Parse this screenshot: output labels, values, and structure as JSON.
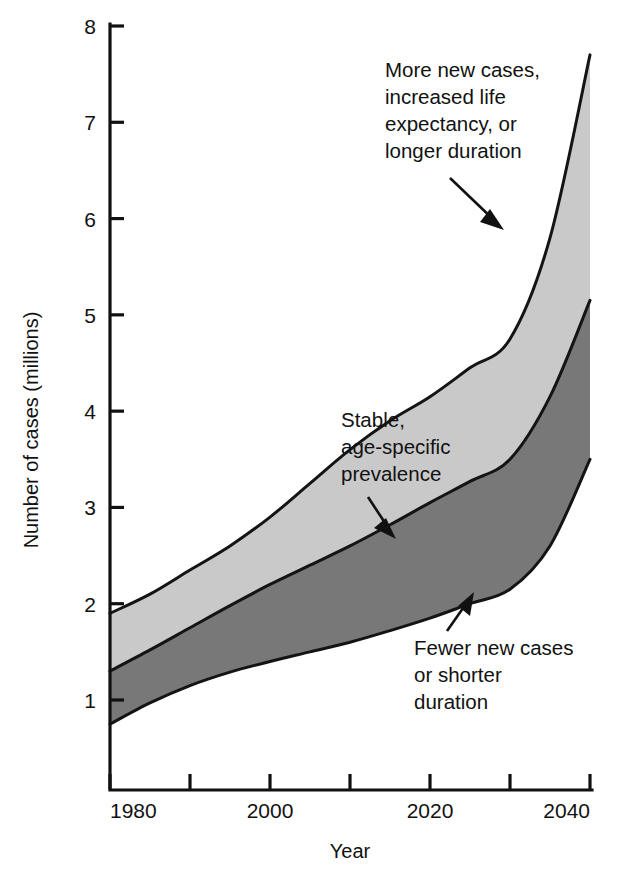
{
  "chart_data": {
    "type": "area",
    "title": "",
    "xlabel": "Year",
    "ylabel": "Number of cases (millions)",
    "xlim": [
      1980,
      2040
    ],
    "ylim": [
      0,
      8
    ],
    "grid": false,
    "legend_position": "none",
    "x": [
      1980,
      1990,
      2000,
      2010,
      2020,
      2030,
      2040
    ],
    "x_ticks_major": [
      1980,
      2000,
      2020,
      2040
    ],
    "x_ticks_minor": [
      1990,
      2010,
      2030
    ],
    "x_tick_labels": [
      "1980",
      "2000",
      "2020",
      "2040"
    ],
    "y_ticks": [
      1,
      2,
      3,
      4,
      5,
      6,
      7,
      8
    ],
    "y_tick_labels": [
      "1",
      "2",
      "3",
      "4",
      "5",
      "6",
      "7",
      "8"
    ],
    "series": [
      {
        "name": "More new cases, increased life expectancy, or longer duration",
        "role": "upper-bound",
        "x": [
          1980,
          1985,
          1990,
          1995,
          2000,
          2005,
          2010,
          2015,
          2020,
          2025,
          2030,
          2035,
          2040
        ],
        "values": [
          1.9,
          2.1,
          2.35,
          2.6,
          2.9,
          3.25,
          3.6,
          3.9,
          4.15,
          4.45,
          4.75,
          5.8,
          7.7
        ]
      },
      {
        "name": "Stable, age-specific prevalence",
        "role": "middle-projection",
        "x": [
          1980,
          1985,
          1990,
          1995,
          2000,
          2005,
          2010,
          2015,
          2020,
          2025,
          2030,
          2035,
          2040
        ],
        "values": [
          1.3,
          1.52,
          1.75,
          1.98,
          2.2,
          2.4,
          2.6,
          2.82,
          3.05,
          3.27,
          3.5,
          4.15,
          5.15
        ]
      },
      {
        "name": "Fewer new cases or shorter duration",
        "role": "lower-bound",
        "x": [
          1980,
          1985,
          1990,
          1995,
          2000,
          2005,
          2010,
          2015,
          2020,
          2025,
          2030,
          2035,
          2040
        ],
        "values": [
          0.75,
          0.97,
          1.15,
          1.29,
          1.4,
          1.5,
          1.6,
          1.72,
          1.85,
          2.0,
          2.15,
          2.6,
          3.5
        ]
      }
    ],
    "bands": [
      {
        "name": "upper-band",
        "between": [
          "Stable, age-specific prevalence",
          "More new cases, increased life expectancy, or longer duration"
        ],
        "fill": "#c9c9c9"
      },
      {
        "name": "lower-band",
        "between": [
          "Fewer new cases or shorter duration",
          "Stable, age-specific prevalence"
        ],
        "fill": "#787878"
      }
    ],
    "annotations": [
      {
        "id": "upper",
        "lines": [
          "More new cases,",
          "increased life",
          "expectancy, or",
          "longer duration"
        ],
        "points_to": {
          "x": 2029,
          "y": 5.75
        }
      },
      {
        "id": "middle",
        "lines": [
          "Stable,",
          "age-specific",
          "prevalence"
        ],
        "points_to": {
          "x": 2016,
          "y": 3.05
        }
      },
      {
        "id": "lower",
        "lines": [
          "Fewer new cases",
          "or shorter",
          "duration"
        ],
        "points_to": {
          "x": 2030,
          "y": 2.15
        }
      }
    ]
  },
  "axes": {
    "y_title": "Number of cases (millions)",
    "x_title": "Year",
    "y_tick_labels": [
      "8",
      "7",
      "6",
      "5",
      "4",
      "3",
      "2",
      "1"
    ],
    "x_tick_labels": [
      "1980",
      "2000",
      "2020",
      "2040"
    ]
  },
  "annotations": {
    "upper": {
      "line1": "More new cases,",
      "line2": "increased life",
      "line3": "expectancy, or",
      "line4": "longer duration"
    },
    "middle": {
      "line1": "Stable,",
      "line2": "age-specific",
      "line3": "prevalence"
    },
    "lower": {
      "line1": "Fewer new cases",
      "line2": "or shorter",
      "line3": "duration"
    }
  },
  "colors": {
    "upper_band": "#c9c9c9",
    "lower_band": "#787878",
    "stroke": "#141414",
    "background": "#ffffff"
  }
}
